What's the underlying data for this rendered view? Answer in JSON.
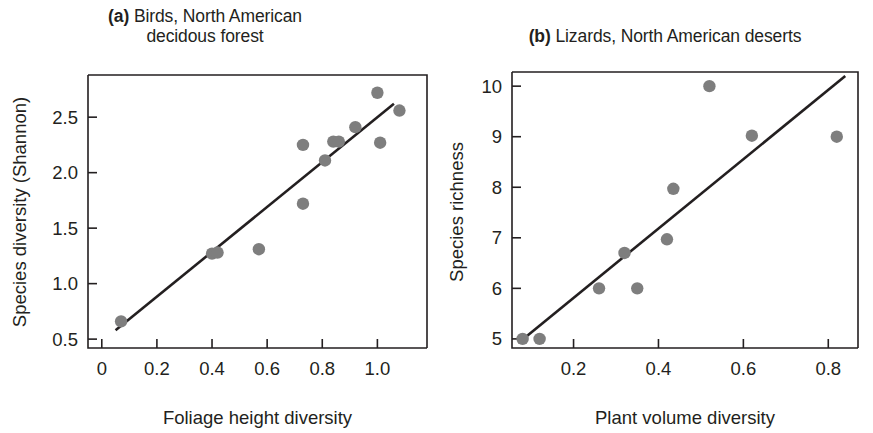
{
  "figure": {
    "panels": [
      {
        "tag": "(a)",
        "title_line1": "Birds, North American",
        "title_line2": "decidous forest"
      },
      {
        "tag": "(b)",
        "title_line1": "Lizards, North American deserts",
        "title_line2": ""
      }
    ],
    "marker_color": "#7e7e7e",
    "line_color": "#231f20"
  },
  "chart_data": [
    {
      "type": "scatter",
      "panel": "a",
      "title": "(a) Birds, North American decidous forest",
      "xlabel": "Foliage height diversity",
      "ylabel": "Species diversity (Shannon)",
      "xlim": [
        -0.05,
        1.18
      ],
      "ylim": [
        0.42,
        2.88
      ],
      "xticks": [
        0,
        0.2,
        0.4,
        0.6,
        0.8,
        1.0
      ],
      "xticklabels": [
        "0",
        "0.2",
        "0.4",
        "0.6",
        "0.8",
        "1.0"
      ],
      "yticks": [
        0.5,
        1.0,
        1.5,
        2.0,
        2.5
      ],
      "yticklabels": [
        "0.5",
        "1.0",
        "1.5",
        "2.0",
        "2.5"
      ],
      "grid": false,
      "legend": "none",
      "x": [
        0.07,
        0.4,
        0.42,
        0.57,
        0.73,
        0.73,
        0.81,
        0.84,
        0.86,
        0.92,
        1.0,
        1.01,
        1.08
      ],
      "y": [
        0.66,
        1.27,
        1.28,
        1.31,
        1.72,
        2.25,
        2.11,
        2.28,
        2.28,
        2.41,
        2.72,
        2.27,
        2.56
      ],
      "fit_line": {
        "x0": 0.05,
        "y0": 0.58,
        "x1": 1.06,
        "y1": 2.62
      }
    },
    {
      "type": "scatter",
      "panel": "b",
      "title": "(b) Lizards, North American deserts",
      "xlabel": "Plant volume diversity",
      "ylabel": "Species richness",
      "xlim": [
        0.055,
        0.87
      ],
      "ylim": [
        4.82,
        10.28
      ],
      "xticks": [
        0.2,
        0.4,
        0.6,
        0.8
      ],
      "xticklabels": [
        "0.2",
        "0.4",
        "0.6",
        "0.8"
      ],
      "yticks": [
        5,
        6,
        7,
        8,
        9,
        10
      ],
      "yticklabels": [
        "5",
        "6",
        "7",
        "8",
        "9",
        "10"
      ],
      "grid": false,
      "legend": "none",
      "x": [
        0.08,
        0.12,
        0.26,
        0.32,
        0.35,
        0.42,
        0.435,
        0.52,
        0.62,
        0.82
      ],
      "y": [
        5.0,
        5.0,
        6.0,
        6.7,
        6.0,
        6.97,
        7.97,
        10.0,
        9.02,
        9.0
      ],
      "fit_line": {
        "x0": 0.07,
        "y0": 4.92,
        "x1": 0.84,
        "y1": 10.2
      }
    }
  ]
}
